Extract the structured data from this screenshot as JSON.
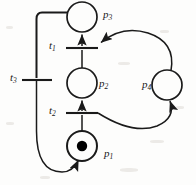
{
  "figure": {
    "background_color": "#fdfdfc",
    "stroke_color": "#1a1a1a",
    "token_color": "#000000"
  },
  "places": [
    {
      "id": "p3",
      "label_base": "p",
      "label_sub": "3",
      "cx": 82,
      "cy": 17,
      "r": 15,
      "tokens": 0,
      "label_x": 103,
      "label_y": 9
    },
    {
      "id": "p2",
      "label_base": "p",
      "label_sub": "2",
      "cx": 82,
      "cy": 83,
      "r": 15,
      "tokens": 0,
      "label_x": 99,
      "label_y": 78
    },
    {
      "id": "p1",
      "label_base": "p",
      "label_sub": "1",
      "cx": 82,
      "cy": 146,
      "r": 15,
      "tokens": 1,
      "label_x": 104,
      "label_y": 148
    },
    {
      "id": "p4",
      "label_base": "p",
      "label_sub": "4",
      "cx": 167,
      "cy": 85,
      "r": 15,
      "tokens": 0,
      "label_x": 142,
      "label_y": 79
    }
  ],
  "transitions": [
    {
      "id": "t1",
      "label_base": "t",
      "label_sub": "1",
      "orientation": "horizontal",
      "x1": 66,
      "y1": 48,
      "x2": 98,
      "y2": 48,
      "label_x": 49,
      "label_y": 40
    },
    {
      "id": "t2",
      "label_base": "t",
      "label_sub": "2",
      "orientation": "horizontal",
      "x1": 66,
      "y1": 113,
      "x2": 98,
      "y2": 113,
      "label_x": 49,
      "label_y": 105
    },
    {
      "id": "t3",
      "label_base": "t",
      "label_sub": "3",
      "orientation": "horizontal",
      "x1": 22,
      "y1": 80,
      "x2": 52,
      "y2": 80,
      "label_x": 10,
      "label_y": 72
    }
  ],
  "arcs": [
    {
      "id": "arc-p2-t2-up",
      "from": "p2",
      "to": "t1",
      "kind": "straight-vertical",
      "arrow": "up"
    },
    {
      "id": "arc-t1-p3",
      "from": "t1",
      "to": "p3",
      "kind": "straight-vertical",
      "arrow": "up"
    },
    {
      "id": "arc-p1-t2",
      "from": "p1",
      "to": "t2",
      "kind": "straight-vertical",
      "arrow": "up"
    },
    {
      "id": "arc-t2-p2",
      "from": "t2",
      "to": "p2",
      "kind": "straight-vertical",
      "arrow": "up"
    },
    {
      "id": "arc-p4-t1",
      "from": "p4",
      "to": "t1",
      "kind": "curve-upper-right",
      "arrow": "left"
    },
    {
      "id": "arc-t2-p4",
      "from": "t2",
      "to": "p4",
      "kind": "curve-lower-right",
      "arrow": "up-right"
    },
    {
      "id": "arc-p3-t3",
      "from": "p3",
      "to": "t3",
      "kind": "orthogonal-left",
      "arrow": "down"
    },
    {
      "id": "arc-t3-p1",
      "from": "t3",
      "to": "p1",
      "kind": "curve-lower-left",
      "arrow": "up-right"
    }
  ]
}
